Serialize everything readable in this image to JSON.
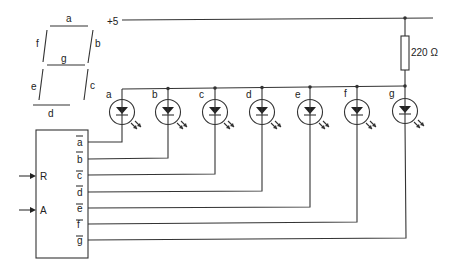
{
  "diagram": {
    "type": "seven-segment LED driver circuit",
    "segment_display": {
      "segments": [
        "a",
        "b",
        "c",
        "d",
        "e",
        "f",
        "g"
      ]
    },
    "supply": {
      "label": "+5"
    },
    "resistor": {
      "label": "220 Ω"
    },
    "leds": [
      {
        "label": "a"
      },
      {
        "label": "b"
      },
      {
        "label": "c"
      },
      {
        "label": "d"
      },
      {
        "label": "e"
      },
      {
        "label": "f"
      },
      {
        "label": "g"
      }
    ],
    "driver": {
      "inputs": [
        {
          "label": "R"
        },
        {
          "label": "A"
        }
      ],
      "outputs": [
        {
          "label": "a"
        },
        {
          "label": "b"
        },
        {
          "label": "c"
        },
        {
          "label": "d"
        },
        {
          "label": "e"
        },
        {
          "label": "f"
        },
        {
          "label": "g"
        }
      ],
      "outputs_inverted": true
    },
    "colors": {
      "ink": "#333333",
      "background": "#ffffff"
    }
  }
}
